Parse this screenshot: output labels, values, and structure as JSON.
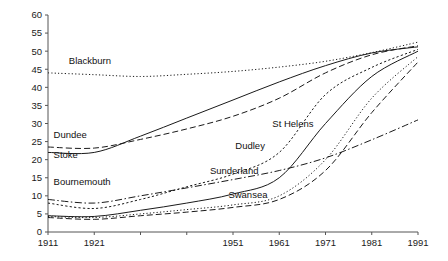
{
  "chart_data": {
    "type": "line",
    "title": "",
    "subtitle": "",
    "xlabel": "",
    "ylabel": "",
    "x": [
      1911,
      1921,
      1931,
      1941,
      1951,
      1961,
      1971,
      1981,
      1991
    ],
    "xlim": [
      1911,
      1991
    ],
    "ylim": [
      0,
      60
    ],
    "xticks": [
      1911,
      1921,
      1931,
      1941,
      1951,
      1961,
      1971,
      1981,
      1991
    ],
    "xtick_labels": [
      "1911",
      "1921",
      "",
      "",
      "1951",
      "1961",
      "1971",
      "1981",
      "1991"
    ],
    "yticks": [
      0,
      5,
      10,
      15,
      20,
      25,
      30,
      35,
      40,
      45,
      50,
      55,
      60
    ],
    "ytick_labels": [
      "0",
      "5",
      "10",
      "15",
      "20",
      "25",
      "30",
      "35",
      "40",
      "45",
      "50",
      "55",
      "60"
    ],
    "grid": false,
    "legend": "inline-labels",
    "series": [
      {
        "name": "Blackburn",
        "style": "dotted",
        "label_x": 1915.5,
        "label_y": 46.5,
        "values": [
          44.0,
          43.5,
          43.0,
          43.6,
          44.4,
          45.6,
          47.2,
          49.6,
          52.5
        ]
      },
      {
        "name": "Dundee",
        "style": "dashed",
        "label_x": 1912.2,
        "label_y": 26.0,
        "values": [
          23.5,
          23.2,
          25.6,
          28.5,
          32.0,
          37.0,
          44.0,
          49.0,
          51.5
        ]
      },
      {
        "name": "Stoke",
        "style": "solid",
        "label_x": 1912.2,
        "label_y": 20.4,
        "values": [
          22.0,
          22.0,
          26.5,
          31.5,
          36.5,
          41.5,
          46.0,
          49.5,
          51.2
        ]
      },
      {
        "name": "Bournemouth",
        "style": "dash-dot",
        "label_x": 1912.2,
        "label_y": 13.0,
        "values": [
          9.0,
          8.0,
          10.0,
          12.2,
          14.5,
          17.0,
          20.5,
          25.5,
          31.0
        ]
      },
      {
        "name": "Dudley",
        "style": "dotted-bold",
        "label_x": 1951.5,
        "label_y": 23.0,
        "values": [
          8.0,
          6.5,
          9.0,
          12.5,
          16.0,
          22.0,
          38.0,
          45.5,
          50.5
        ]
      },
      {
        "name": "St Helens",
        "style": "solid",
        "label_x": 1959.5,
        "label_y": 29.0,
        "values": [
          4.5,
          4.3,
          6.0,
          8.0,
          10.5,
          15.0,
          30.0,
          43.0,
          50.0
        ]
      },
      {
        "name": "Sunderland",
        "style": "dotted",
        "label_x": 1946.0,
        "label_y": 16.0,
        "values": [
          4.3,
          4.0,
          5.0,
          6.2,
          7.5,
          10.0,
          20.0,
          37.0,
          48.5
        ]
      },
      {
        "name": "Swansea",
        "style": "dashed",
        "label_x": 1950.0,
        "label_y": 9.5,
        "values": [
          4.0,
          3.5,
          4.5,
          5.5,
          6.8,
          9.0,
          17.0,
          33.0,
          47.0
        ]
      }
    ]
  }
}
